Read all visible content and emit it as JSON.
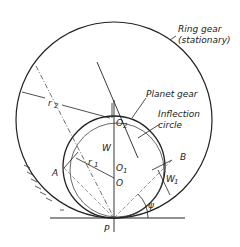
{
  "diagram": {
    "labels": {
      "ring_gear": "Ring gear",
      "stationary": "(stationary)",
      "planet_gear": "Planet gear",
      "inflection": "Inflection",
      "circle": "circle",
      "r2": "r",
      "r2_sub": "2",
      "r1": "r",
      "r1_sub": "1",
      "o2": "O",
      "o2_sub": "2",
      "o1": "O",
      "o1_sub": "1",
      "o": "O",
      "w": "W",
      "w1": "W",
      "w1_sub": "1",
      "a": "A",
      "b": "B",
      "p": "P",
      "psi": "ψ"
    }
  }
}
